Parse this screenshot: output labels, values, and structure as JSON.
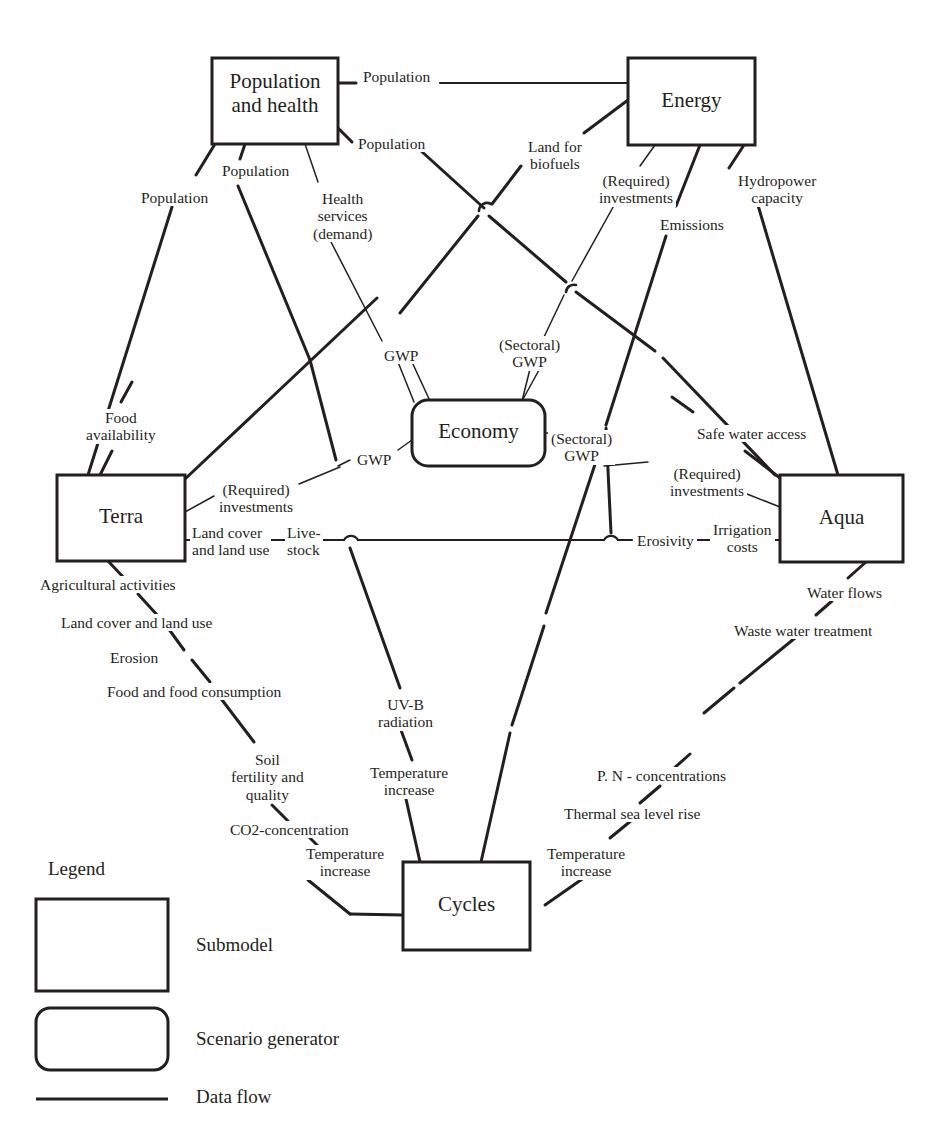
{
  "diagram": {
    "nodes": [
      {
        "id": "population_health",
        "label": "Population\nand health",
        "shape": "submodel",
        "x": 212,
        "y": 58,
        "w": 126,
        "h": 86,
        "font": 21
      },
      {
        "id": "energy",
        "label": "Energy",
        "shape": "submodel",
        "x": 628,
        "y": 58,
        "w": 127,
        "h": 87,
        "font": 21
      },
      {
        "id": "terra",
        "label": "Terra",
        "shape": "submodel",
        "x": 57,
        "y": 475,
        "w": 128,
        "h": 86,
        "font": 21
      },
      {
        "id": "aqua",
        "label": "Aqua",
        "shape": "submodel",
        "x": 780,
        "y": 475,
        "w": 123,
        "h": 87,
        "font": 21
      },
      {
        "id": "cycles",
        "label": "Cycles",
        "shape": "submodel",
        "x": 403,
        "y": 862,
        "w": 127,
        "h": 88,
        "font": 21
      },
      {
        "id": "economy",
        "label": "Economy",
        "shape": "scenario-generator",
        "x": 412,
        "y": 400,
        "w": 133,
        "h": 66,
        "font": 21
      }
    ],
    "edge_labels": [
      {
        "id": "population-top",
        "text": "Population",
        "x": 360,
        "y": 68,
        "font": 15.5,
        "align": "left"
      },
      {
        "id": "population-diag-right",
        "text": "Population",
        "x": 355,
        "y": 135,
        "font": 15.5,
        "align": "left"
      },
      {
        "id": "population-left-outer",
        "text": "Population",
        "x": 138,
        "y": 189,
        "font": 15.5,
        "align": "left"
      },
      {
        "id": "population-left-inner",
        "text": "Population",
        "x": 219,
        "y": 162,
        "font": 15.5,
        "align": "left"
      },
      {
        "id": "health-services-demand",
        "text": "Health\nservices\n(demand)",
        "x": 310,
        "y": 190,
        "font": 15.5,
        "align": "left"
      },
      {
        "id": "land-for-biofuels",
        "text": "Land for\nbiofuels",
        "x": 525,
        "y": 138,
        "font": 15.5,
        "align": "left"
      },
      {
        "id": "required-investments-energy",
        "text": "(Required)\ninvestments",
        "x": 596,
        "y": 172,
        "font": 15.5,
        "align": "left"
      },
      {
        "id": "emissions",
        "text": "Emissions",
        "x": 657,
        "y": 216,
        "font": 15.5,
        "align": "left"
      },
      {
        "id": "hydropower-capacity",
        "text": "Hydropower\ncapacity",
        "x": 735,
        "y": 172,
        "font": 15.5,
        "align": "left"
      },
      {
        "id": "food-availability",
        "text": "Food\navailability",
        "x": 83,
        "y": 409,
        "font": 15.5,
        "align": "left"
      },
      {
        "id": "gwp-left-upper",
        "text": "GWP",
        "x": 381,
        "y": 347,
        "font": 15.5,
        "align": "left"
      },
      {
        "id": "sectoral-gwp-upper",
        "text": "(Sectoral)\nGWP",
        "x": 496,
        "y": 336,
        "font": 15.5,
        "align": "left"
      },
      {
        "id": "gwp-terra",
        "text": "GWP",
        "x": 354,
        "y": 451,
        "font": 15.5,
        "align": "left"
      },
      {
        "id": "sectoral-gwp-right",
        "text": "(Sectoral)\nGWP",
        "x": 548,
        "y": 430,
        "font": 15.5,
        "align": "left"
      },
      {
        "id": "required-investments-terra",
        "text": "(Required)\ninvestments",
        "x": 216,
        "y": 481,
        "font": 15.5,
        "align": "left"
      },
      {
        "id": "land-cover-land-use",
        "text": "Land cover\nand land use",
        "x": 190,
        "y": 524,
        "font": 15.5,
        "align": "left"
      },
      {
        "id": "livestock",
        "text": "Live-\nstock",
        "x": 285,
        "y": 524,
        "font": 15.5,
        "align": "left"
      },
      {
        "id": "safe-water-access",
        "text": "Safe water access",
        "x": 694,
        "y": 425,
        "font": 15.5,
        "align": "left"
      },
      {
        "id": "required-investments-aqua",
        "text": "(Required)\ninvestments",
        "x": 667,
        "y": 465,
        "font": 15.5,
        "align": "left"
      },
      {
        "id": "erosivity",
        "text": "Erosivity",
        "x": 634,
        "y": 532,
        "font": 15.5,
        "align": "left"
      },
      {
        "id": "irrigation-costs",
        "text": "Irrigation\ncosts",
        "x": 710,
        "y": 521,
        "font": 15.5,
        "align": "left"
      },
      {
        "id": "agricultural-activities",
        "text": "Agricultural activities",
        "x": 37,
        "y": 576,
        "font": 15.5,
        "align": "left"
      },
      {
        "id": "land-cover-land-use-2",
        "text": "Land cover and land use",
        "x": 58,
        "y": 614,
        "font": 15.5,
        "align": "left"
      },
      {
        "id": "erosion",
        "text": "Erosion",
        "x": 107,
        "y": 649,
        "font": 15.5,
        "align": "left"
      },
      {
        "id": "food-and-food-consumption",
        "text": "Food and food consumption",
        "x": 104,
        "y": 683,
        "font": 15.5,
        "align": "left"
      },
      {
        "id": "soil-fertility-quality",
        "text": "Soil\nfertility and\nquality",
        "x": 228,
        "y": 751,
        "font": 15.5,
        "align": "left"
      },
      {
        "id": "co2-concentration",
        "text": "CO2-concentration",
        "x": 227,
        "y": 821,
        "font": 15.5,
        "align": "left"
      },
      {
        "id": "temperature-increase-left",
        "text": "Temperature\nincrease",
        "x": 303,
        "y": 845,
        "font": 15.5,
        "align": "left"
      },
      {
        "id": "uv-b-radiation",
        "text": "UV-B\nradiation",
        "x": 375,
        "y": 696,
        "font": 15.5,
        "align": "left"
      },
      {
        "id": "temperature-increase-mid",
        "text": "Temperature\nincrease",
        "x": 367,
        "y": 764,
        "font": 15.5,
        "align": "left"
      },
      {
        "id": "water-flows",
        "text": "Water flows",
        "x": 804,
        "y": 584,
        "font": 15.5,
        "align": "left"
      },
      {
        "id": "waste-water-treatment",
        "text": "Waste water treatment",
        "x": 731,
        "y": 622,
        "font": 15.5,
        "align": "left"
      },
      {
        "id": "pn-concentrations",
        "text": "P. N - concentrations",
        "x": 594,
        "y": 767,
        "font": 15.5,
        "align": "left"
      },
      {
        "id": "thermal-sea-level-rise",
        "text": "Thermal sea level rise",
        "x": 561,
        "y": 805,
        "font": 15.5,
        "align": "left"
      },
      {
        "id": "temperature-increase-right",
        "text": "Temperature\nincrease",
        "x": 544,
        "y": 845,
        "font": 15.5,
        "align": "left"
      }
    ],
    "legend": {
      "title": "Legend",
      "title_x": 48,
      "title_y": 858,
      "title_font": 19,
      "items": [
        {
          "id": "submodel",
          "label": "Submodel",
          "shape": "rect",
          "swatch_x": 36,
          "swatch_y": 899,
          "swatch_w": 132,
          "swatch_h": 92,
          "text_x": 196,
          "text_y": 934
        },
        {
          "id": "scenario-generator",
          "label": "Scenario generator",
          "shape": "round-rect",
          "swatch_x": 36,
          "swatch_y": 1008,
          "swatch_w": 132,
          "swatch_h": 62,
          "text_x": 196,
          "text_y": 1028
        },
        {
          "id": "data-flow",
          "label": "Data flow",
          "shape": "line",
          "swatch_x": 36,
          "swatch_y": 1098,
          "swatch_w": 132,
          "swatch_h": 3,
          "text_x": 196,
          "text_y": 1085
        }
      ],
      "item_font": 19
    },
    "colors": {
      "stroke": "#231f20",
      "text": "#231f20",
      "background": "#ffffff"
    }
  }
}
